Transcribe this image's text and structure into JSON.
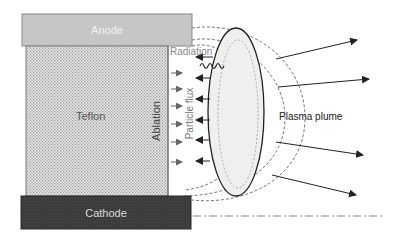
{
  "diagram": {
    "labels": {
      "anode": "Anode",
      "cathode": "Cathode",
      "teflon": "Teflon",
      "ablation": "Ablation",
      "particle_flux": "Particle flux",
      "radiation": "Radiation",
      "plasma_plume": "Plasma plume"
    },
    "colors": {
      "anode_fill": "#c6c6c6",
      "cathode_fill": "#3c3c3c",
      "teflon_fill": "#d4d4d4",
      "plume_fill": "#eeeeee",
      "line": "#222222",
      "dashed": "#777777"
    },
    "components": [
      {
        "name": "anode",
        "type": "electrode"
      },
      {
        "name": "teflon",
        "type": "propellant-bar"
      },
      {
        "name": "cathode",
        "type": "electrode"
      },
      {
        "name": "plasma-plume",
        "type": "ellipse"
      },
      {
        "name": "ablation-arrows",
        "count": 6,
        "direction": "right"
      },
      {
        "name": "particle-flux-arrows",
        "count": 6,
        "direction": "left"
      },
      {
        "name": "outflow-arrows",
        "count": 4,
        "direction": "right"
      },
      {
        "name": "radiation-wave",
        "type": "wavy-line"
      },
      {
        "name": "axis-line",
        "type": "dash-dot"
      }
    ]
  }
}
